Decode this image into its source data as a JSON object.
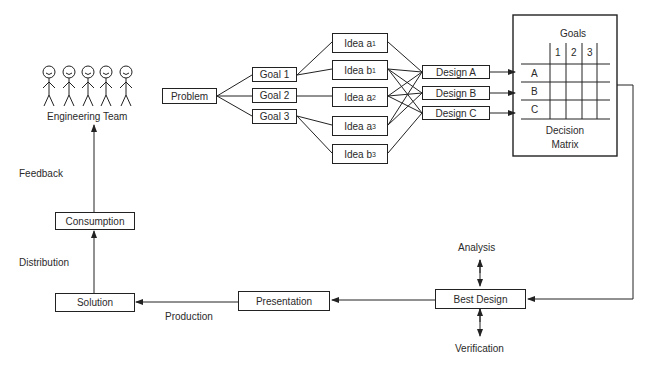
{
  "team": {
    "label": "Engineering Team",
    "members": 5
  },
  "problem": "Problem",
  "goals": [
    "Goal 1",
    "Goal 2",
    "Goal 3"
  ],
  "ideas": [
    {
      "name": "Idea a",
      "sub": "1"
    },
    {
      "name": "Idea b",
      "sub": "1"
    },
    {
      "name": "Idea a",
      "sub": "2"
    },
    {
      "name": "Idea a",
      "sub": "3"
    },
    {
      "name": "Idea b",
      "sub": "3"
    }
  ],
  "designs": [
    "Design A",
    "Design B",
    "Design C"
  ],
  "matrix": {
    "title": "Goals",
    "columns": [
      "1",
      "2",
      "3"
    ],
    "rows": [
      "A",
      "B",
      "C"
    ],
    "caption_line1": "Decision",
    "caption_line2": "Matrix"
  },
  "best_design": "Best Design",
  "analysis": "Analysis",
  "verification": "Verification",
  "presentation": "Presentation",
  "production": "Production",
  "solution": "Solution",
  "distribution": "Distribution",
  "consumption": "Consumption",
  "feedback": "Feedback"
}
